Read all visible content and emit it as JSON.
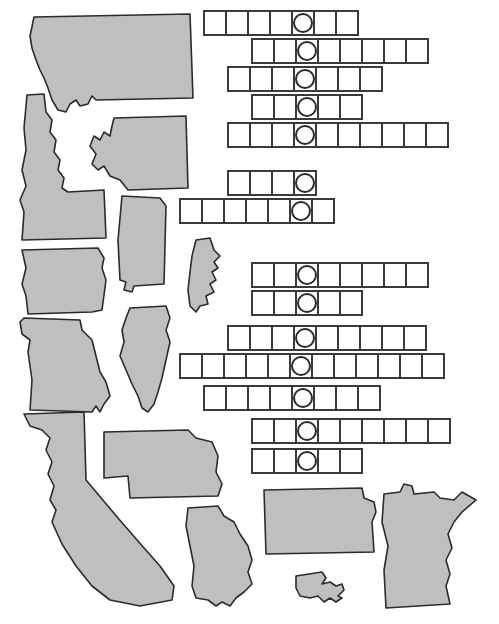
{
  "worksheet": {
    "title": "State Shapes Puzzle Worksheet",
    "background_color": "#ffffff",
    "shape_fill_color": "#bfbfbf",
    "shape_stroke_color": "#2b2b2b",
    "cell_fill_color": "#ffffff",
    "cell_stroke_color": "#3a3a3a",
    "circle_stroke_color": "#2b2b2b"
  },
  "state_shapes": [
    {
      "name": "montana",
      "label": "Montana"
    },
    {
      "name": "idaho",
      "label": "Idaho"
    },
    {
      "name": "washington",
      "label": "Washington"
    },
    {
      "name": "alabama",
      "label": "Alabama"
    },
    {
      "name": "maine",
      "label": "Maine"
    },
    {
      "name": "iowa",
      "label": "Iowa"
    },
    {
      "name": "missouri",
      "label": "Missouri"
    },
    {
      "name": "illinois",
      "label": "Illinois"
    },
    {
      "name": "california",
      "label": "California"
    },
    {
      "name": "nebraska",
      "label": "Nebraska"
    },
    {
      "name": "georgia",
      "label": "Georgia"
    },
    {
      "name": "kansas",
      "label": "Kansas"
    },
    {
      "name": "massachusetts",
      "label": "Massachusetts"
    },
    {
      "name": "minnesota",
      "label": "Minnesota"
    }
  ],
  "answer_grid": {
    "cell_width": 24,
    "cell_height": 26,
    "rows": [
      {
        "index": 1,
        "cells": 7,
        "circled_index": 4,
        "left": 203,
        "top": 10,
        "values": [
          "",
          "",
          "",
          "",
          "",
          "",
          ""
        ]
      },
      {
        "index": 2,
        "cells": 8,
        "circled_index": 2,
        "left": 251,
        "top": 38,
        "values": [
          "",
          "",
          "",
          "",
          "",
          "",
          "",
          ""
        ]
      },
      {
        "index": 3,
        "cells": 7,
        "circled_index": 3,
        "left": 227,
        "top": 66,
        "values": [
          "",
          "",
          "",
          "",
          "",
          "",
          ""
        ]
      },
      {
        "index": 4,
        "cells": 5,
        "circled_index": 2,
        "left": 251,
        "top": 94,
        "values": [
          "",
          "",
          "",
          "",
          ""
        ]
      },
      {
        "index": 5,
        "cells": 10,
        "circled_index": 3,
        "left": 227,
        "top": 122,
        "values": [
          "",
          "",
          "",
          "",
          "",
          "",
          "",
          "",
          "",
          ""
        ]
      },
      {
        "index": 6,
        "cells": 4,
        "circled_index": 3,
        "left": 227,
        "top": 170,
        "values": [
          "",
          "",
          "",
          ""
        ]
      },
      {
        "index": 7,
        "cells": 7,
        "circled_index": 5,
        "left": 179,
        "top": 198,
        "values": [
          "",
          "",
          "",
          "",
          "",
          "",
          ""
        ]
      },
      {
        "index": 8,
        "cells": 8,
        "circled_index": 2,
        "left": 251,
        "top": 262,
        "values": [
          "",
          "",
          "",
          "",
          "",
          "",
          "",
          ""
        ]
      },
      {
        "index": 9,
        "cells": 5,
        "circled_index": 2,
        "left": 251,
        "top": 290,
        "values": [
          "",
          "",
          "",
          "",
          ""
        ]
      },
      {
        "index": 10,
        "cells": 9,
        "circled_index": 3,
        "left": 227,
        "top": 325,
        "values": [
          "",
          "",
          "",
          "",
          "",
          "",
          "",
          "",
          ""
        ]
      },
      {
        "index": 11,
        "cells": 12,
        "circled_index": 5,
        "left": 179,
        "top": 353,
        "values": [
          "",
          "",
          "",
          "",
          "",
          "",
          "",
          "",
          "",
          "",
          "",
          ""
        ]
      },
      {
        "index": 12,
        "cells": 8,
        "circled_index": 4,
        "left": 203,
        "top": 385,
        "values": [
          "",
          "",
          "",
          "",
          "",
          "",
          "",
          ""
        ]
      },
      {
        "index": 13,
        "cells": 9,
        "circled_index": 2,
        "left": 251,
        "top": 418,
        "values": [
          "",
          "",
          "",
          "",
          "",
          "",
          "",
          "",
          ""
        ]
      },
      {
        "index": 14,
        "cells": 5,
        "circled_index": 2,
        "left": 251,
        "top": 448,
        "values": [
          "",
          "",
          "",
          "",
          ""
        ]
      }
    ]
  }
}
